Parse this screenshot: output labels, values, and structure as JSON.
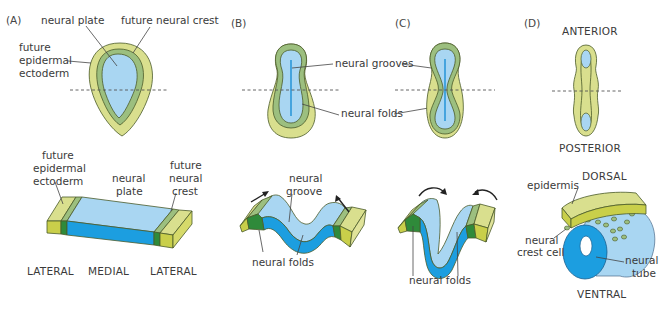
{
  "colors": {
    "epidermal_ectoderm": "#d9df8e",
    "neural_crest": "#9cbf7f",
    "neural_plate": "#a9d6f2",
    "neural_tube": "#1c9ee0",
    "crest_dark": "#2f8a3a",
    "groove_line": "#1a8fd6"
  },
  "panels": {
    "A": {
      "label": "(A)",
      "top_labels": {
        "neural_plate": "neural plate",
        "future_neural_crest": "future neural crest",
        "future_epidermal_ectoderm": [
          "future",
          "epidermal",
          "ectoderm"
        ]
      },
      "block_labels": {
        "future_epidermal_ectoderm": [
          "future",
          "epidermal",
          "ectoderm"
        ],
        "neural_plate": [
          "neural",
          "plate"
        ],
        "future_neural_crest": [
          "future",
          "neural",
          "crest"
        ]
      },
      "axis_labels": {
        "left": "LATERAL",
        "middle": "MEDIAL",
        "right": "LATERAL"
      }
    },
    "B": {
      "label": "(B)",
      "top_labels": {
        "neural_grooves": "neural grooves",
        "neural_folds": "neural folds"
      },
      "block_labels": {
        "neural_groove": [
          "neural",
          "groove"
        ],
        "neural_folds": "neural folds"
      }
    },
    "C": {
      "label": "(C)",
      "block_labels": {
        "neural_folds": "neural folds"
      }
    },
    "D": {
      "label": "(D)",
      "top_labels": {
        "anterior": "ANTERIOR",
        "posterior": "POSTERIOR"
      },
      "block_labels": {
        "dorsal": "DORSAL",
        "ventral": "VENTRAL",
        "epidermis": "epidermis",
        "neural_crest_cell": [
          "neural",
          "crest cell"
        ],
        "neural_tube": [
          "neural",
          "tube"
        ]
      }
    }
  }
}
